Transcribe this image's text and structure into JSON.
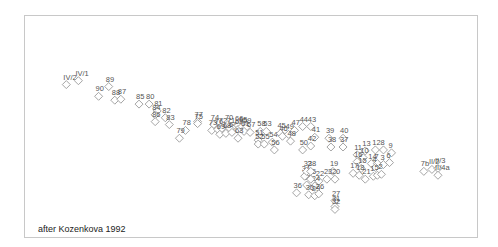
{
  "chart_data": {
    "type": "scatter",
    "title": "",
    "xlabel": "",
    "ylabel": "",
    "grid": false,
    "legend": "none",
    "annotation": "after Kozenkova 1992",
    "xlim": [
      0,
      100
    ],
    "ylim": [
      0,
      100
    ],
    "marker": "diamond",
    "points": [
      {
        "label": "IV/2",
        "x": 7.5,
        "y": 72
      },
      {
        "label": "IV/1",
        "x": 10.5,
        "y": 74
      },
      {
        "label": "89",
        "x": 18,
        "y": 71
      },
      {
        "label": "90",
        "x": 15.5,
        "y": 66
      },
      {
        "label": "88",
        "x": 19.5,
        "y": 64
      },
      {
        "label": "87",
        "x": 21,
        "y": 64.5
      },
      {
        "label": "85",
        "x": 25.5,
        "y": 62
      },
      {
        "label": "80",
        "x": 28,
        "y": 62
      },
      {
        "label": "81",
        "x": 30,
        "y": 58.5
      },
      {
        "label": "84",
        "x": 29.5,
        "y": 56.5
      },
      {
        "label": "86",
        "x": 29.5,
        "y": 53
      },
      {
        "label": "82",
        "x": 32,
        "y": 55
      },
      {
        "label": "83",
        "x": 33,
        "y": 51.5
      },
      {
        "label": "78",
        "x": 37,
        "y": 48.5
      },
      {
        "label": "79",
        "x": 35.5,
        "y": 44.5
      },
      {
        "label": "77",
        "x": 40,
        "y": 53
      },
      {
        "label": "75",
        "x": 40,
        "y": 52
      },
      {
        "label": "74",
        "x": 44,
        "y": 51.5
      },
      {
        "label": "73",
        "x": 43.5,
        "y": 48.5
      },
      {
        "label": "76",
        "x": 45,
        "y": 49
      },
      {
        "label": "72",
        "x": 46,
        "y": 49.5
      },
      {
        "label": "70",
        "x": 47.5,
        "y": 51.5
      },
      {
        "label": "71",
        "x": 48,
        "y": 49.5
      },
      {
        "label": "69",
        "x": 45.5,
        "y": 46.5
      },
      {
        "label": "68",
        "x": 47,
        "y": 47
      },
      {
        "label": "64",
        "x": 48.5,
        "y": 47.5
      },
      {
        "label": "66",
        "x": 50,
        "y": 51
      },
      {
        "label": "62",
        "x": 50,
        "y": 49
      },
      {
        "label": "65",
        "x": 51,
        "y": 50.5
      },
      {
        "label": "59",
        "x": 52,
        "y": 50
      },
      {
        "label": "61",
        "x": 51.5,
        "y": 48
      },
      {
        "label": "57",
        "x": 53,
        "y": 47.5
      },
      {
        "label": "63",
        "x": 50,
        "y": 44.5
      },
      {
        "label": "58",
        "x": 55.5,
        "y": 48
      },
      {
        "label": "53",
        "x": 57,
        "y": 48
      },
      {
        "label": "51",
        "x": 55,
        "y": 43.5
      },
      {
        "label": "52",
        "x": 55,
        "y": 41.5
      },
      {
        "label": "55",
        "x": 56.5,
        "y": 41.5
      },
      {
        "label": "54",
        "x": 58.5,
        "y": 42.5
      },
      {
        "label": "56",
        "x": 59,
        "y": 38.5
      },
      {
        "label": "45",
        "x": 60.5,
        "y": 47
      },
      {
        "label": "46",
        "x": 61,
        "y": 45.5
      },
      {
        "label": "49",
        "x": 62.5,
        "y": 46.5
      },
      {
        "label": "47",
        "x": 64,
        "y": 48.5
      },
      {
        "label": "44",
        "x": 66,
        "y": 50.5
      },
      {
        "label": "43",
        "x": 68,
        "y": 50.5
      },
      {
        "label": "48",
        "x": 63,
        "y": 43
      },
      {
        "label": "41",
        "x": 69,
        "y": 45
      },
      {
        "label": "42",
        "x": 68,
        "y": 40.5
      },
      {
        "label": "50",
        "x": 66,
        "y": 38.5
      },
      {
        "label": "39",
        "x": 72.5,
        "y": 44.5
      },
      {
        "label": "40",
        "x": 76,
        "y": 44.5
      },
      {
        "label": "38",
        "x": 73,
        "y": 40
      },
      {
        "label": "37",
        "x": 76,
        "y": 40
      },
      {
        "label": "11",
        "x": 79.5,
        "y": 36
      },
      {
        "label": "13",
        "x": 81.5,
        "y": 38
      },
      {
        "label": "12",
        "x": 84,
        "y": 38.5
      },
      {
        "label": "8",
        "x": 86,
        "y": 38.5
      },
      {
        "label": "9",
        "x": 88,
        "y": 37
      },
      {
        "label": "10",
        "x": 81,
        "y": 34.5
      },
      {
        "label": "16",
        "x": 79.5,
        "y": 32.5
      },
      {
        "label": "14",
        "x": 83,
        "y": 31.5
      },
      {
        "label": "7",
        "x": 84.5,
        "y": 31.5
      },
      {
        "label": "3",
        "x": 86,
        "y": 31
      },
      {
        "label": "6",
        "x": 87.5,
        "y": 32
      },
      {
        "label": "15",
        "x": 80.5,
        "y": 29
      },
      {
        "label": "4",
        "x": 84,
        "y": 29.5
      },
      {
        "label": "1",
        "x": 83.5,
        "y": 25
      },
      {
        "label": "5",
        "x": 84.5,
        "y": 25.5
      },
      {
        "label": "2",
        "x": 85.5,
        "y": 26
      },
      {
        "label": "17",
        "x": 78.5,
        "y": 26.5
      },
      {
        "label": "18",
        "x": 80,
        "y": 25.5
      },
      {
        "label": "21",
        "x": 81.5,
        "y": 23.5
      },
      {
        "label": "19",
        "x": 73.5,
        "y": 27.5
      },
      {
        "label": "20",
        "x": 74,
        "y": 23.5
      },
      {
        "label": "23",
        "x": 72,
        "y": 23.5
      },
      {
        "label": "22",
        "x": 70,
        "y": 22.5
      },
      {
        "label": "24",
        "x": 69,
        "y": 20
      },
      {
        "label": "25",
        "x": 67,
        "y": 20.5
      },
      {
        "label": "34",
        "x": 66.5,
        "y": 25
      },
      {
        "label": "35",
        "x": 68,
        "y": 23.5
      },
      {
        "label": "33",
        "x": 67,
        "y": 27.5
      },
      {
        "label": "28",
        "x": 68,
        "y": 27.5
      },
      {
        "label": "36",
        "x": 64.5,
        "y": 16.5
      },
      {
        "label": "30",
        "x": 67.5,
        "y": 15.5
      },
      {
        "label": "29",
        "x": 69,
        "y": 15
      },
      {
        "label": "26",
        "x": 70,
        "y": 16
      },
      {
        "label": "27",
        "x": 74,
        "y": 12.5
      },
      {
        "label": "31",
        "x": 74,
        "y": 9.5
      },
      {
        "label": "32",
        "x": 74,
        "y": 8
      },
      {
        "label": "7b",
        "x": 96,
        "y": 27.5
      },
      {
        "label": "II/2",
        "x": 98,
        "y": 28.5
      },
      {
        "label": "II/3",
        "x": 99.5,
        "y": 29
      },
      {
        "label": "II/4a",
        "x": 99.5,
        "y": 25.5
      }
    ]
  }
}
